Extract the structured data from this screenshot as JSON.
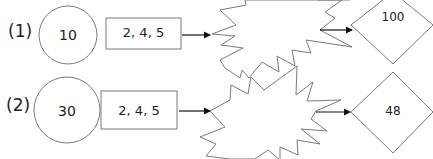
{
  "rows": [
    {
      "label": "(1)",
      "circle_value": "10",
      "box_values": "2, 4, 5",
      "diamond_value": "100"
    },
    {
      "label": "(2)",
      "circle_value": "30",
      "box_values": "2, 4, 5",
      "diamond_value": "48"
    }
  ],
  "colors": {
    "stroke": "#7a7a7a",
    "arrow": "#111111",
    "text": "#222222"
  }
}
